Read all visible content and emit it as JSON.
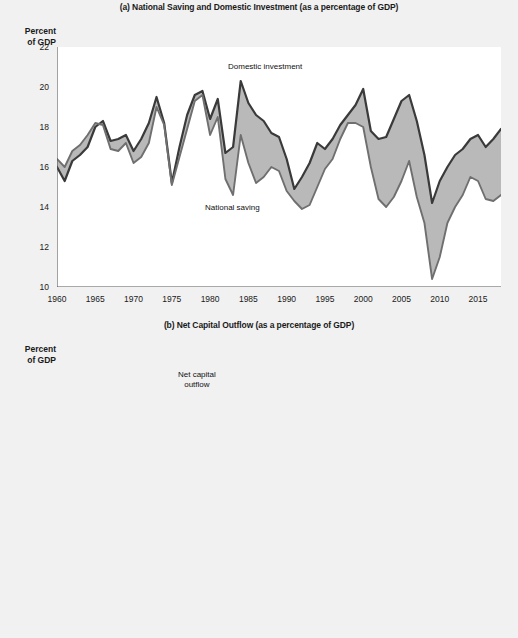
{
  "figure": {
    "axis_caption_line1": "Percent",
    "axis_caption_line2": "of GDP"
  },
  "panel_a": {
    "title": "(a) National Saving and Domestic Investment (as a percentage of GDP)",
    "annotation_investment": "Domestic investment",
    "annotation_saving": "National saving"
  },
  "panel_b": {
    "title": "(b) Net Capital Outflow (as a percentage of GDP)",
    "annotation_line1": "Net capital",
    "annotation_line2": "outflow"
  },
  "colors": {
    "investment_line": "#3a3a3a",
    "saving_line": "#6f6f6f",
    "gap_fill": "#b9b9b9",
    "nco_line": "#4a4a4a",
    "zero_line": "#8a8a8a",
    "axis": "#555555",
    "plot_bg": "#ffffff",
    "page_bg": "#f1f1f1"
  },
  "chart_data": [
    {
      "type": "area",
      "id": "panel-a",
      "title": "(a) National Saving and Domestic Investment (as a percentage of GDP)",
      "xlabel": "",
      "ylabel": "Percent of GDP",
      "xlim": [
        1960,
        2018
      ],
      "ylim": [
        10,
        22
      ],
      "ytick_step": 2,
      "yticks": [
        10,
        12,
        14,
        16,
        18,
        20,
        22
      ],
      "xticks": [
        1960,
        1965,
        1970,
        1975,
        1980,
        1985,
        1990,
        1995,
        2000,
        2005,
        2010,
        2015
      ],
      "grid": false,
      "legend": "inline-annotations",
      "x": [
        1960,
        1961,
        1962,
        1963,
        1964,
        1965,
        1966,
        1967,
        1968,
        1969,
        1970,
        1971,
        1972,
        1973,
        1974,
        1975,
        1976,
        1977,
        1978,
        1979,
        1980,
        1981,
        1982,
        1983,
        1984,
        1985,
        1986,
        1987,
        1988,
        1989,
        1990,
        1991,
        1992,
        1993,
        1994,
        1995,
        1996,
        1997,
        1998,
        1999,
        2000,
        2001,
        2002,
        2003,
        2004,
        2005,
        2006,
        2007,
        2008,
        2009,
        2010,
        2011,
        2012,
        2013,
        2014,
        2015,
        2016,
        2017,
        2018
      ],
      "series": [
        {
          "name": "Domestic investment",
          "values": [
            16.0,
            15.3,
            16.3,
            16.6,
            17.0,
            18.0,
            18.3,
            17.3,
            17.4,
            17.6,
            16.8,
            17.4,
            18.2,
            19.5,
            18.2,
            15.2,
            17.0,
            18.6,
            19.6,
            19.8,
            18.4,
            19.4,
            16.7,
            17.0,
            20.3,
            19.2,
            18.6,
            18.3,
            17.7,
            17.5,
            16.4,
            14.9,
            15.5,
            16.2,
            17.2,
            16.9,
            17.4,
            18.1,
            18.6,
            19.1,
            19.9,
            17.8,
            17.4,
            17.5,
            18.4,
            19.3,
            19.6,
            18.3,
            16.6,
            14.2,
            15.3,
            16.0,
            16.6,
            16.9,
            17.4,
            17.6,
            17.0,
            17.4,
            17.9
          ]
        },
        {
          "name": "National saving",
          "values": [
            16.4,
            16.0,
            16.8,
            17.1,
            17.6,
            18.2,
            18.1,
            16.9,
            16.8,
            17.2,
            16.2,
            16.5,
            17.2,
            19.0,
            18.1,
            15.1,
            16.5,
            17.9,
            19.3,
            19.6,
            17.6,
            18.5,
            15.4,
            14.6,
            17.6,
            16.2,
            15.2,
            15.5,
            16.0,
            15.8,
            14.8,
            14.3,
            13.9,
            14.1,
            15.0,
            15.9,
            16.4,
            17.4,
            18.2,
            18.2,
            18.0,
            16.0,
            14.4,
            14.0,
            14.5,
            15.3,
            16.3,
            14.5,
            13.2,
            10.4,
            11.5,
            13.2,
            14.0,
            14.6,
            15.5,
            15.3,
            14.4,
            14.3,
            14.6
          ]
        }
      ]
    },
    {
      "type": "line",
      "id": "panel-b",
      "title": "(b) Net Capital Outflow (as a percentage of GDP)",
      "xlabel": "",
      "ylabel": "Percent of GDP",
      "xlim": [
        1960,
        2018
      ],
      "ylim": [
        -6,
        2
      ],
      "ytick_step": 1,
      "yticks": [
        2,
        1,
        0,
        -1,
        -2,
        -3,
        -4,
        -5,
        -6
      ],
      "xticks": [
        1960,
        1965,
        1970,
        1975,
        1980,
        1985,
        1990,
        1995,
        2000,
        2005,
        2010,
        2015
      ],
      "grid": false,
      "zero_line": true,
      "series": [
        {
          "name": "Net capital outflow",
          "values": [
            0.8,
            0.7,
            0.75,
            0.8,
            1.0,
            0.9,
            0.5,
            0.45,
            0.25,
            0.2,
            0.2,
            -0.1,
            -0.35,
            0.25,
            -0.25,
            1.0,
            -0.1,
            -0.7,
            -0.6,
            0.15,
            0.4,
            0.2,
            -0.1,
            -1.1,
            -2.3,
            -2.6,
            -3.0,
            -2.8,
            -2.2,
            -1.8,
            -1.4,
            -0.75,
            -0.8,
            -1.05,
            -1.25,
            -1.2,
            -1.2,
            -1.45,
            -2.2,
            -2.9,
            -3.7,
            -3.6,
            -4.1,
            -4.4,
            -5.0,
            -5.5,
            -5.6,
            -4.6,
            -4.4,
            -2.6,
            -2.8,
            -3.1,
            -2.9,
            -2.5,
            -2.5,
            -2.5,
            -2.6,
            -3.1,
            -3.0
          ]
        }
      ]
    }
  ]
}
